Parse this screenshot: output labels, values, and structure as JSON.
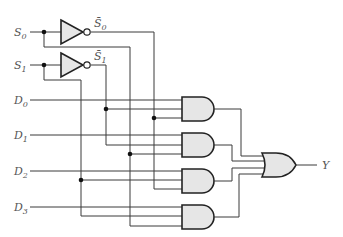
{
  "diagram": {
    "type": "4-to-1 multiplexer logic circuit",
    "inputs": {
      "select": [
        {
          "name": "S",
          "sub": "0",
          "complement_label": "S̄",
          "complement_sub": "0"
        },
        {
          "name": "S",
          "sub": "1",
          "complement_label": "S̄",
          "complement_sub": "1"
        }
      ],
      "data": [
        {
          "name": "D",
          "sub": "0"
        },
        {
          "name": "D",
          "sub": "1"
        },
        {
          "name": "D",
          "sub": "2"
        },
        {
          "name": "D",
          "sub": "3"
        }
      ]
    },
    "output": {
      "name": "Y"
    },
    "gates": {
      "inverters": [
        "NOT S0",
        "NOT S1"
      ],
      "and_gates": [
        {
          "inputs": [
            "D0",
            "S̄1",
            "S̄0"
          ]
        },
        {
          "inputs": [
            "D1",
            "S̄1",
            "S0"
          ]
        },
        {
          "inputs": [
            "D2",
            "S1",
            "S̄0"
          ]
        },
        {
          "inputs": [
            "D3",
            "S1",
            "S0"
          ]
        }
      ],
      "or_gate": {
        "inputs": [
          "AND0",
          "AND1",
          "AND2",
          "AND3"
        ],
        "output": "Y"
      }
    },
    "colors": {
      "gate_fill": "#e6e6e6",
      "wire": "#3a3a3a",
      "label": "#555555"
    }
  }
}
